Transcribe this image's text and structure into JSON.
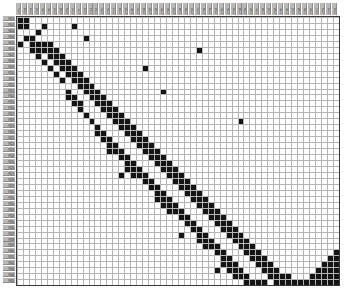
{
  "figure": {
    "title": "",
    "caption": "",
    "background_color": "#ffffff"
  },
  "axes": {
    "frame_color": "#3a3a3a",
    "gridline_color": "#b4b4b4",
    "cell_fill_color": "#141414",
    "cell_empty_color": "#ffffff",
    "label_band_color": "#b8b8b8",
    "label_text_color": "#4a4a4a",
    "x_label": "",
    "y_label": ""
  },
  "chart_data": {
    "type": "heatmap",
    "title": "",
    "subtitle": "",
    "xlabel": "",
    "ylabel": "",
    "grid": true,
    "legend_position": "none",
    "value_scale": "binary",
    "value_labels": {
      "0": "absent",
      "1": "present"
    },
    "colorscale": {
      "0": "#ffffff",
      "1": "#141414"
    },
    "n_cols": 54,
    "n_rows": 45,
    "cell_px": 5.96,
    "origin_px": {
      "x": 16,
      "y": 16
    },
    "x_tick_labels": [
      "C01",
      "C02",
      "C03",
      "C04",
      "C05",
      "C06",
      "C07",
      "C08",
      "C09",
      "C10",
      "C11",
      "C12",
      "C13",
      "C14",
      "C15",
      "C16",
      "C17",
      "C18",
      "C19",
      "C20",
      "C21",
      "C22",
      "C23",
      "C24",
      "C25",
      "C26",
      "C27",
      "C28",
      "C29",
      "C30",
      "C31",
      "C32",
      "C33",
      "C34",
      "C35",
      "C36",
      "C37",
      "C38",
      "C39",
      "C40",
      "C41",
      "C42",
      "C43",
      "C44",
      "C45",
      "C46",
      "C47",
      "C48",
      "C49",
      "C50",
      "C51",
      "C52",
      "C53",
      "C54"
    ],
    "y_tick_labels": [
      "R01",
      "R02",
      "R03",
      "R04",
      "R05",
      "R06",
      "R07",
      "R08",
      "R09",
      "R10",
      "R11",
      "R12",
      "R13",
      "R14",
      "R15",
      "R16",
      "R17",
      "R18",
      "R19",
      "R20",
      "R21",
      "R22",
      "R23",
      "R24",
      "R25",
      "R26",
      "R27",
      "R28",
      "R29",
      "R30",
      "R31",
      "R32",
      "R33",
      "R34",
      "R35",
      "R36",
      "R37",
      "R38",
      "R39",
      "R40",
      "R41",
      "R42",
      "R43",
      "R44",
      "R45"
    ],
    "filled_cells": [
      [
        0,
        0
      ],
      [
        0,
        1
      ],
      [
        0,
        4
      ],
      [
        1,
        0
      ],
      [
        1,
        1
      ],
      [
        1,
        3
      ],
      [
        2,
        3
      ],
      [
        2,
        4
      ],
      [
        2,
        5
      ],
      [
        3,
        2
      ],
      [
        3,
        4
      ],
      [
        3,
        5
      ],
      [
        3,
        6
      ],
      [
        4,
        1
      ],
      [
        4,
        4
      ],
      [
        4,
        5
      ],
      [
        4,
        7
      ],
      [
        5,
        4
      ],
      [
        5,
        5
      ],
      [
        5,
        6
      ],
      [
        5,
        8
      ],
      [
        6,
        5
      ],
      [
        6,
        6
      ],
      [
        6,
        7
      ],
      [
        6,
        9
      ],
      [
        7,
        6
      ],
      [
        7,
        7
      ],
      [
        7,
        8
      ],
      [
        7,
        10
      ],
      [
        8,
        7
      ],
      [
        8,
        8
      ],
      [
        8,
        9
      ],
      [
        8,
        12
      ],
      [
        8,
        13
      ],
      [
        9,
        1
      ],
      [
        9,
        8
      ],
      [
        9,
        9
      ],
      [
        9,
        10
      ],
      [
        9,
        13
      ],
      [
        9,
        14
      ],
      [
        10,
        9
      ],
      [
        10,
        10
      ],
      [
        10,
        11
      ],
      [
        10,
        14
      ],
      [
        10,
        15
      ],
      [
        11,
        3
      ],
      [
        11,
        10
      ],
      [
        11,
        11
      ],
      [
        11,
        12
      ],
      [
        11,
        16
      ],
      [
        12,
        11
      ],
      [
        12,
        12
      ],
      [
        12,
        13
      ],
      [
        12,
        17
      ],
      [
        13,
        12
      ],
      [
        13,
        13
      ],
      [
        13,
        14
      ],
      [
        13,
        18
      ],
      [
        13,
        19
      ],
      [
        14,
        13
      ],
      [
        14,
        14
      ],
      [
        14,
        15
      ],
      [
        14,
        19
      ],
      [
        14,
        20
      ],
      [
        15,
        14
      ],
      [
        15,
        15
      ],
      [
        15,
        16
      ],
      [
        15,
        20
      ],
      [
        15,
        21
      ],
      [
        15,
        22
      ],
      [
        16,
        15
      ],
      [
        16,
        16
      ],
      [
        16,
        17
      ],
      [
        16,
        21
      ],
      [
        16,
        22
      ],
      [
        17,
        16
      ],
      [
        17,
        17
      ],
      [
        17,
        18
      ],
      [
        17,
        22
      ],
      [
        17,
        23
      ],
      [
        17,
        26
      ],
      [
        18,
        17
      ],
      [
        18,
        18
      ],
      [
        18,
        19
      ],
      [
        18,
        23
      ],
      [
        18,
        24
      ],
      [
        18,
        25
      ],
      [
        19,
        18
      ],
      [
        19,
        19
      ],
      [
        19,
        20
      ],
      [
        19,
        24
      ],
      [
        19,
        25
      ],
      [
        19,
        26
      ],
      [
        20,
        19
      ],
      [
        20,
        20
      ],
      [
        20,
        21
      ],
      [
        20,
        25
      ],
      [
        20,
        26
      ],
      [
        21,
        8
      ],
      [
        21,
        20
      ],
      [
        21,
        21
      ],
      [
        21,
        22
      ],
      [
        21,
        26
      ],
      [
        21,
        27
      ],
      [
        22,
        21
      ],
      [
        22,
        22
      ],
      [
        22,
        23
      ],
      [
        22,
        27
      ],
      [
        22,
        28
      ],
      [
        23,
        22
      ],
      [
        23,
        23
      ],
      [
        23,
        24
      ],
      [
        23,
        28
      ],
      [
        23,
        29
      ],
      [
        23,
        30
      ],
      [
        24,
        12
      ],
      [
        24,
        23
      ],
      [
        24,
        24
      ],
      [
        24,
        25
      ],
      [
        24,
        29
      ],
      [
        24,
        30
      ],
      [
        24,
        31
      ],
      [
        25,
        24
      ],
      [
        25,
        25
      ],
      [
        25,
        26
      ],
      [
        25,
        30
      ],
      [
        25,
        31
      ],
      [
        25,
        32
      ],
      [
        26,
        25
      ],
      [
        26,
        26
      ],
      [
        26,
        27
      ],
      [
        26,
        31
      ],
      [
        26,
        32
      ],
      [
        27,
        26
      ],
      [
        27,
        27
      ],
      [
        27,
        28
      ],
      [
        27,
        32
      ],
      [
        27,
        33
      ],
      [
        27,
        36
      ],
      [
        28,
        27
      ],
      [
        28,
        28
      ],
      [
        28,
        29
      ],
      [
        28,
        33
      ],
      [
        28,
        34
      ],
      [
        29,
        28
      ],
      [
        29,
        29
      ],
      [
        29,
        30
      ],
      [
        29,
        34
      ],
      [
        29,
        35
      ],
      [
        30,
        5
      ],
      [
        30,
        29
      ],
      [
        30,
        30
      ],
      [
        30,
        31
      ],
      [
        30,
        35
      ],
      [
        30,
        36
      ],
      [
        30,
        37
      ],
      [
        31,
        30
      ],
      [
        31,
        31
      ],
      [
        31,
        32
      ],
      [
        31,
        36
      ],
      [
        31,
        37
      ],
      [
        31,
        38
      ],
      [
        32,
        31
      ],
      [
        32,
        32
      ],
      [
        32,
        33
      ],
      [
        32,
        37
      ],
      [
        32,
        38
      ],
      [
        33,
        32
      ],
      [
        33,
        33
      ],
      [
        33,
        34
      ],
      [
        33,
        38
      ],
      [
        33,
        39
      ],
      [
        33,
        42
      ],
      [
        34,
        33
      ],
      [
        34,
        34
      ],
      [
        34,
        35
      ],
      [
        34,
        39
      ],
      [
        34,
        40
      ],
      [
        34,
        41
      ],
      [
        35,
        34
      ],
      [
        35,
        35
      ],
      [
        35,
        36
      ],
      [
        35,
        40
      ],
      [
        35,
        41
      ],
      [
        35,
        42
      ],
      [
        36,
        35
      ],
      [
        36,
        36
      ],
      [
        36,
        37
      ],
      [
        36,
        41
      ],
      [
        36,
        42
      ],
      [
        36,
        43
      ],
      [
        37,
        17
      ],
      [
        37,
        36
      ],
      [
        37,
        37
      ],
      [
        37,
        38
      ],
      [
        37,
        42
      ],
      [
        37,
        43
      ],
      [
        38,
        37
      ],
      [
        38,
        38
      ],
      [
        38,
        39
      ],
      [
        38,
        43
      ],
      [
        38,
        44
      ],
      [
        39,
        38
      ],
      [
        39,
        39
      ],
      [
        39,
        40
      ],
      [
        39,
        44
      ],
      [
        40,
        39
      ],
      [
        40,
        40
      ],
      [
        40,
        41
      ],
      [
        40,
        44
      ],
      [
        41,
        40
      ],
      [
        41,
        41
      ],
      [
        41,
        42
      ],
      [
        41,
        44
      ],
      [
        42,
        41
      ],
      [
        42,
        42
      ],
      [
        42,
        43
      ],
      [
        43,
        42
      ],
      [
        43,
        43
      ],
      [
        43,
        44
      ],
      [
        44,
        43
      ],
      [
        44,
        44
      ],
      [
        45,
        43
      ],
      [
        45,
        44
      ],
      [
        46,
        44
      ],
      [
        47,
        44
      ],
      [
        48,
        44
      ],
      [
        49,
        43
      ],
      [
        49,
        44
      ],
      [
        50,
        42
      ],
      [
        50,
        43
      ],
      [
        50,
        44
      ],
      [
        51,
        41
      ],
      [
        51,
        42
      ],
      [
        51,
        43
      ],
      [
        51,
        44
      ],
      [
        52,
        40
      ],
      [
        52,
        41
      ],
      [
        52,
        42
      ],
      [
        52,
        43
      ],
      [
        52,
        44
      ],
      [
        53,
        39
      ],
      [
        53,
        40
      ],
      [
        53,
        41
      ],
      [
        53,
        42
      ],
      [
        53,
        43
      ],
      [
        53,
        44
      ]
    ]
  }
}
